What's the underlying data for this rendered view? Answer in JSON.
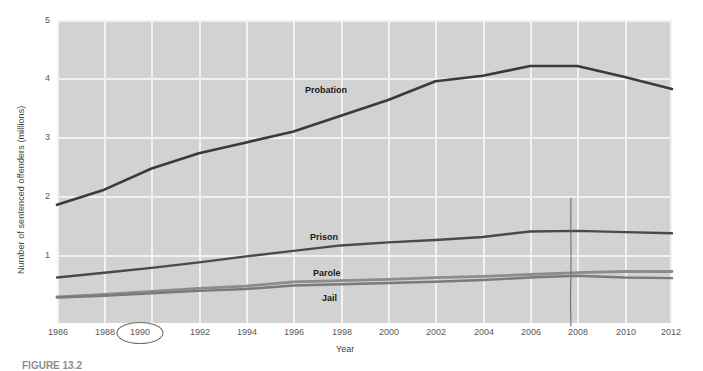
{
  "figure": {
    "caption": "FIGURE 13.2"
  },
  "axes": {
    "ylabel": "Number of sentenced offenders (millions)",
    "xlabel": "Year",
    "yticks": [
      "1",
      "2",
      "3",
      "4",
      "5"
    ],
    "xticks": [
      "1986",
      "1988",
      "1990",
      "1992",
      "1994",
      "1996",
      "1998",
      "2000",
      "2002",
      "2004",
      "2006",
      "2008",
      "2010",
      "2012"
    ]
  },
  "annotations": {
    "circled_year": "1990",
    "vline_year": "2008"
  },
  "series_labels": {
    "probation": "Probation",
    "prison": "Prison",
    "parole": "Parole",
    "jail": "Jail"
  },
  "colors": {
    "plot_background": "#d2d2d2",
    "grid": "#f2f2f2",
    "probation": "#3a3a3c",
    "prison": "#4a4a4c",
    "parole": "#8c8c8e",
    "jail": "#7a7a7c",
    "annotation": "#6e6e70",
    "tick_text": "#58585a"
  },
  "chart_data": {
    "type": "line",
    "title": "",
    "xlabel": "Year",
    "ylabel": "Number of sentenced offenders (millions)",
    "xlim": [
      1986,
      2012
    ],
    "ylim": [
      0,
      5
    ],
    "grid": true,
    "legend": "inline-labels",
    "x": [
      1986,
      1988,
      1990,
      1992,
      1994,
      1996,
      1998,
      2000,
      2002,
      2004,
      2006,
      2008,
      2010,
      2012
    ],
    "series": [
      {
        "name": "Probation",
        "values": [
          1.95,
          2.2,
          2.55,
          2.8,
          2.98,
          3.16,
          3.42,
          3.68,
          3.99,
          4.08,
          4.24,
          4.24,
          4.06,
          3.86
        ]
      },
      {
        "name": "Prison",
        "values": [
          0.75,
          0.83,
          0.91,
          1.0,
          1.1,
          1.19,
          1.28,
          1.33,
          1.37,
          1.42,
          1.51,
          1.52,
          1.5,
          1.48
        ]
      },
      {
        "name": "Parole",
        "values": [
          0.43,
          0.47,
          0.52,
          0.57,
          0.61,
          0.68,
          0.7,
          0.72,
          0.75,
          0.77,
          0.8,
          0.83,
          0.85,
          0.85
        ]
      },
      {
        "name": "Jail",
        "values": [
          0.42,
          0.45,
          0.49,
          0.53,
          0.56,
          0.62,
          0.64,
          0.66,
          0.68,
          0.71,
          0.75,
          0.78,
          0.75,
          0.74
        ]
      }
    ]
  }
}
